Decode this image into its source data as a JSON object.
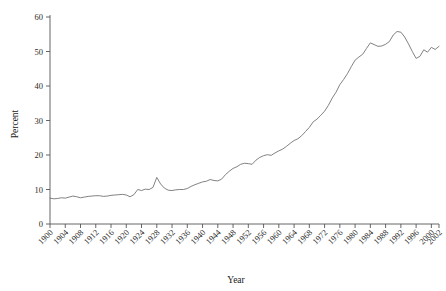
{
  "chart_data": {
    "type": "line",
    "title": "",
    "xlabel": "Year",
    "ylabel": "Percent",
    "xlim": [
      1900,
      2002
    ],
    "ylim": [
      0,
      60
    ],
    "grid": false,
    "legend": null,
    "y_ticks": [
      0,
      10,
      20,
      30,
      40,
      50,
      60
    ],
    "y_tick_labels": [
      "0",
      "10",
      "20",
      "30",
      "40",
      "50",
      "60"
    ],
    "x_ticks": [
      1900,
      1904,
      1908,
      1912,
      1916,
      1920,
      1924,
      1928,
      1932,
      1936,
      1940,
      1944,
      1948,
      1952,
      1956,
      1960,
      1964,
      1968,
      1972,
      1976,
      1980,
      1984,
      1988,
      1992,
      1996,
      2000,
      2002
    ],
    "x_tick_labels": [
      "1900",
      "1904",
      "1908",
      "1912",
      "1916",
      "1920",
      "1924",
      "1928",
      "1932",
      "1936",
      "1940",
      "1944",
      "1948",
      "1952",
      "1956",
      "1960",
      "1964",
      "1968",
      "1972",
      "1976",
      "1980",
      "1984",
      "1988",
      "1992",
      "1996",
      "2000",
      "2002"
    ],
    "x_tick_label_rotation": 45,
    "line_color": "#6b6b6b",
    "series": [
      {
        "name": "Percent",
        "x": [
          1900,
          1901,
          1902,
          1903,
          1904,
          1905,
          1906,
          1907,
          1908,
          1909,
          1910,
          1911,
          1912,
          1913,
          1914,
          1915,
          1916,
          1917,
          1918,
          1919,
          1920,
          1921,
          1922,
          1923,
          1924,
          1925,
          1926,
          1927,
          1928,
          1929,
          1930,
          1931,
          1932,
          1933,
          1934,
          1935,
          1936,
          1937,
          1938,
          1939,
          1940,
          1941,
          1942,
          1943,
          1944,
          1945,
          1946,
          1947,
          1948,
          1949,
          1950,
          1951,
          1952,
          1953,
          1954,
          1955,
          1956,
          1957,
          1958,
          1959,
          1960,
          1961,
          1962,
          1963,
          1964,
          1965,
          1966,
          1967,
          1968,
          1969,
          1970,
          1971,
          1972,
          1973,
          1974,
          1975,
          1976,
          1977,
          1978,
          1979,
          1980,
          1981,
          1982,
          1983,
          1984,
          1985,
          1986,
          1987,
          1988,
          1989,
          1990,
          1991,
          1992,
          1993,
          1994,
          1995,
          1996,
          1997,
          1998,
          1999,
          2000,
          2001,
          2002
        ],
        "y": [
          7.5,
          7.3,
          7.4,
          7.6,
          7.5,
          7.8,
          8.1,
          7.9,
          7.6,
          7.8,
          8.0,
          8.1,
          8.2,
          8.2,
          8.0,
          8.1,
          8.3,
          8.4,
          8.5,
          8.6,
          8.4,
          7.9,
          8.5,
          10.0,
          9.7,
          10.1,
          10.0,
          10.6,
          13.5,
          11.6,
          10.4,
          9.8,
          9.7,
          9.9,
          10.0,
          10.0,
          10.3,
          10.9,
          11.4,
          11.8,
          12.2,
          12.4,
          12.9,
          12.6,
          12.5,
          13.0,
          14.3,
          15.3,
          16.1,
          16.6,
          17.3,
          17.6,
          17.5,
          17.3,
          18.5,
          19.3,
          19.8,
          20.1,
          19.9,
          20.6,
          21.2,
          21.7,
          22.5,
          23.4,
          24.2,
          24.7,
          25.6,
          26.8,
          28.0,
          29.6,
          30.4,
          31.5,
          32.7,
          34.4,
          36.5,
          38.2,
          40.4,
          41.9,
          43.6,
          45.6,
          47.5,
          48.4,
          49.2,
          50.9,
          52.5,
          52.0,
          51.5,
          51.6,
          52.1,
          52.9,
          54.8,
          55.8,
          55.6,
          54.2,
          52.2,
          50.0,
          48.0,
          48.6,
          50.5,
          49.8,
          51.2,
          50.6,
          51.5
        ]
      }
    ]
  },
  "axes": {
    "ylabel": "Percent",
    "xlabel": "Year"
  }
}
